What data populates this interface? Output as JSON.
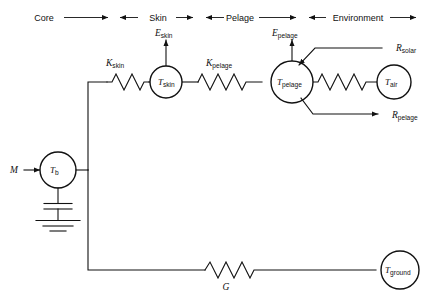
{
  "diagram": {
    "regions": [
      {
        "id": "core",
        "label": "Core"
      },
      {
        "id": "skin",
        "label": "Skin"
      },
      {
        "id": "pelage",
        "label": "Pelage"
      },
      {
        "id": "environment",
        "label": "Environment"
      }
    ],
    "nodes": [
      {
        "id": "t-b",
        "symbol": "T",
        "subscript": "b"
      },
      {
        "id": "t-skin",
        "symbol": "T",
        "subscript": "skin"
      },
      {
        "id": "t-pelage",
        "symbol": "T",
        "subscript": "pelage"
      },
      {
        "id": "t-air",
        "symbol": "T",
        "subscript": "air"
      },
      {
        "id": "t-ground",
        "symbol": "T",
        "subscript": "ground"
      }
    ],
    "resistors": [
      {
        "id": "k-skin",
        "symbol": "K",
        "subscript": "skin"
      },
      {
        "id": "k-pelage",
        "symbol": "K",
        "subscript": "pelage"
      },
      {
        "id": "r-air",
        "symbol": "",
        "subscript": ""
      },
      {
        "id": "g",
        "symbol": "G",
        "subscript": ""
      }
    ],
    "sources": [
      {
        "id": "m",
        "symbol": "M",
        "subscript": ""
      }
    ],
    "fluxes": [
      {
        "id": "e-skin",
        "symbol": "E",
        "subscript": "skin",
        "direction": "up"
      },
      {
        "id": "e-pelage",
        "symbol": "E",
        "subscript": "pelage",
        "direction": "up"
      },
      {
        "id": "r-solar",
        "symbol": "R",
        "subscript": "solar",
        "direction": "in"
      },
      {
        "id": "r-pelage",
        "symbol": "R",
        "subscript": "pelage",
        "direction": "out"
      }
    ],
    "ground_symbol": "earth-ground",
    "capacitor_symbol": "capacitor",
    "colors": {
      "line": "#111111",
      "background": "#ffffff"
    }
  }
}
